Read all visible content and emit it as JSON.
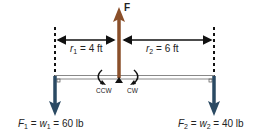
{
  "force_label": "F",
  "r1": {
    "var": "r",
    "sub": "1",
    "text": " = 4 ft"
  },
  "r2": {
    "var": "r",
    "sub": "2",
    "text": " = 6 ft"
  },
  "rotation": {
    "ccw": "CCW",
    "cw": "CW"
  },
  "f1": {
    "f": "F",
    "fsub": "1",
    "eq1": " = ",
    "w": "w",
    "wsub": "1",
    "eq2": " = 60 lb"
  },
  "f2": {
    "f": "F",
    "fsub": "2",
    "eq1": " = ",
    "w": "w",
    "wsub": "2",
    "eq2": " = 40 lb"
  },
  "colors": {
    "upward_force": "#8a4f2a",
    "weights": "#2b4a63",
    "beam": "#888888",
    "lines": "#111111"
  }
}
